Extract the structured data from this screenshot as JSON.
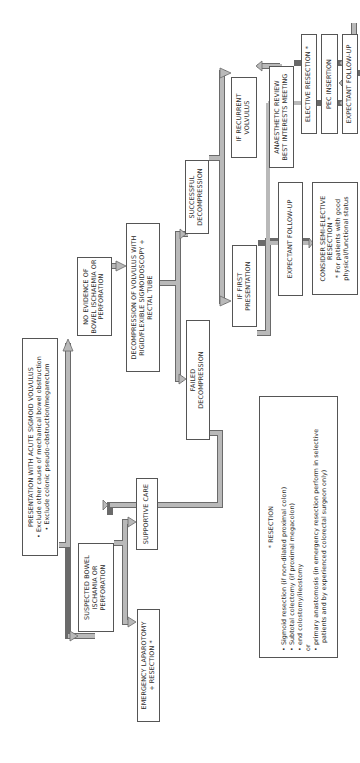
{
  "diagram": {
    "orientation": "rotated-90-ccw",
    "colors": {
      "arrow_fill": "#b9b9b9",
      "arrow_stroke": "#6a6a6a",
      "box_border": "#555555",
      "text": "#2a2a2a"
    },
    "nodes": {
      "presentation": {
        "title": "PRESENTATION WITH ACUTE SIGMOID VOLVULUS",
        "bullets": [
          "Exclude other cause of mechanical bowel obstruction",
          "Exclude colonic pseudo-obstruction/megarectum"
        ]
      },
      "no_evidence": {
        "lines": [
          "NO EVIDENCE OF",
          "BOWEL ISCHAEMIA OR",
          "PERFORATION"
        ]
      },
      "suspected": {
        "lines": [
          "SUSPECTED BOWEL",
          "ISCHAMIA OR",
          "PERFORATION"
        ]
      },
      "decompression": {
        "lines": [
          "DECOMPRESSION OF VOLVULUS WITH",
          "RIGID/FLEXIBLE SIGMOIDOSCOPY +",
          "RECTAL TUBE"
        ]
      },
      "emergency_laparotomy": {
        "lines": [
          "EMERGENCY LAPAROTOMY",
          "+ RESECTION *"
        ]
      },
      "supportive_care": {
        "lines": [
          "SUPPORTIVE CARE"
        ]
      },
      "failed_decompression": {
        "lines": [
          "FAILED",
          "DECOMPRESSION"
        ]
      },
      "successful_decompression": {
        "lines": [
          "SUCCESSFUL",
          "DECOMPRESSION"
        ]
      },
      "if_first": {
        "lines": [
          "IF FIRST",
          "PRESENTATION"
        ]
      },
      "if_recurrent": {
        "lines": [
          "IF RECURRENT",
          "VOLVULUS"
        ]
      },
      "expectant_first": {
        "lines": [
          "EXPECTANT FOLLOW-UP"
        ]
      },
      "semi_elective": {
        "lines": [
          "CONSIDER SEMI-ELECTIVE",
          "RESECTION *"
        ],
        "footnote_lines": [
          "* For patients with good",
          "physical/functional status"
        ]
      },
      "anaesthetic_review": {
        "lines": [
          "ANAESTHETIC REVIEW",
          "BEST INTERESTS MEETING"
        ]
      },
      "elective_resection": {
        "lines": [
          "ELECTIVE RESECTION *"
        ]
      },
      "pec_insertion": {
        "lines": [
          "PEC INSERTION"
        ]
      },
      "expectant_recurrent": {
        "lines": [
          "EXPECTANT FOLLOW-UP"
        ]
      }
    },
    "resection_note": {
      "title": "* RESECTION",
      "items": [
        "Sigmoid resection (if non-dilated proximal colon)",
        "Subtotal colectomy (if proximal megacolon)",
        "end colostomy/ileostomy"
      ],
      "or_label": "or",
      "final_item_lines": [
        "primary anastomosis (in emergency resection perform in selective",
        "patients and by experienced colorectal surgeon only)"
      ]
    }
  }
}
